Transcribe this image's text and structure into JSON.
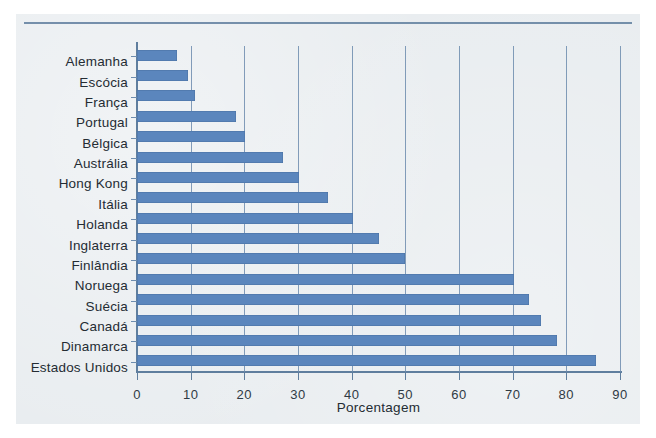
{
  "chart_data": {
    "type": "bar",
    "orientation": "horizontal",
    "title": "",
    "xlabel": "Porcentagem",
    "ylabel": "",
    "xlim": [
      0,
      90
    ],
    "xticks": [
      0,
      10,
      20,
      30,
      40,
      50,
      60,
      70,
      80,
      90
    ],
    "grid": "vertical",
    "legend": "none",
    "categories": [
      "Alemanha",
      "Escócia",
      "França",
      "Portugal",
      "Bélgica",
      "Austrália",
      "Hong Kong",
      "Itália",
      "Holanda",
      "Inglaterra",
      "Finlândia",
      "Noruega",
      "Suécia",
      "Canadá",
      "Dinamarca",
      "Estados Unidos"
    ],
    "values": [
      7.5,
      9.5,
      10.8,
      18.4,
      20.2,
      27.2,
      30.2,
      35.5,
      40.2,
      45.0,
      50.0,
      70.2,
      73.0,
      75.2,
      78.3,
      85.5
    ],
    "series": [
      {
        "name": "Porcentagem",
        "values": [
          7.5,
          9.5,
          10.8,
          18.4,
          20.2,
          27.2,
          30.2,
          35.5,
          40.2,
          45.0,
          50.0,
          70.2,
          73.0,
          75.2,
          78.3,
          85.5
        ]
      }
    ],
    "colors": {
      "bar": "#5b86bd",
      "axis": "#5f7e9e",
      "grid": "#6d8cae",
      "background": "#e9edf0",
      "text": "#242c33"
    }
  }
}
